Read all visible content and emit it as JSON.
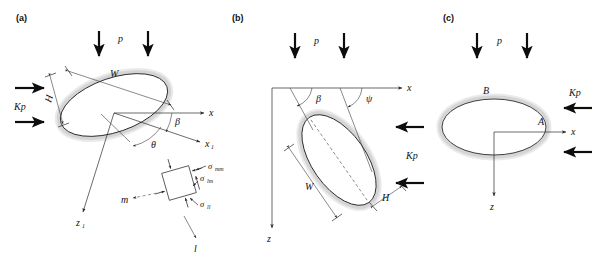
{
  "figure": {
    "background": "#ffffff",
    "ink_color": "#2b2b2b",
    "halo_color": "#d4d4d4",
    "width": 600,
    "height": 263
  },
  "panels": [
    {
      "id": "a",
      "label": "(a)",
      "description": "Inclined elliptical borehole cross-section with rotated coordinate frame and stress element",
      "labels": {
        "load_p": "p",
        "confining": "Kp",
        "width": "W",
        "height": "H",
        "axis_x": "x",
        "axis_x1": "x",
        "axis_x1_sub": "1",
        "axis_z1": "z",
        "axis_z1_sub": "1",
        "angle_beta": "β",
        "angle_theta": "θ",
        "axis_m": "m",
        "axis_l": "l",
        "stress_mm": "σ",
        "stress_mm_sub": "mm",
        "stress_lm": "σ",
        "stress_lm_sub": "lm",
        "stress_ll": "σ",
        "stress_ll_sub": "ll"
      }
    },
    {
      "id": "b",
      "label": "(b)",
      "description": "Tilted ellipse with beta and psi angles measured from the x axis, dashed major axis",
      "labels": {
        "load_p": "p",
        "confining": "Kp",
        "width": "W",
        "height": "H",
        "axis_x": "x",
        "axis_z": "z",
        "angle_beta": "β",
        "angle_psi": "ψ"
      }
    },
    {
      "id": "c",
      "label": "(c)",
      "description": "Horizontal ellipse plan view with points A on the x axis and B at the crown",
      "labels": {
        "load_p": "p",
        "confining": "Kp",
        "axis_x": "x",
        "axis_z": "z",
        "point_a": "A",
        "point_b": "B"
      }
    }
  ]
}
